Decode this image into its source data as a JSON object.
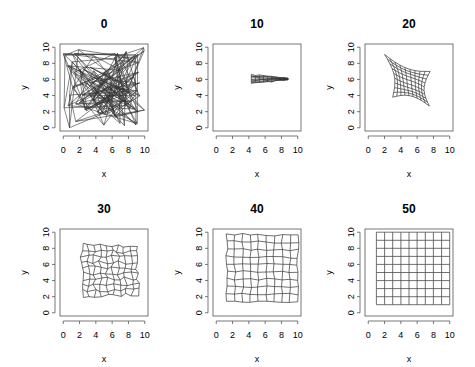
{
  "chart_data": {
    "type": "line",
    "layout": {
      "rows": 2,
      "cols": 3
    },
    "xlim": [
      0,
      10
    ],
    "ylim": [
      0,
      10
    ],
    "x_ticks": [
      "0",
      "2",
      "4",
      "6",
      "8",
      "10"
    ],
    "y_ticks": [
      "0",
      "2",
      "4",
      "6",
      "8",
      "10"
    ],
    "grid": false,
    "panels": [
      {
        "title": "0",
        "xlabel": "x",
        "ylabel": "y",
        "state": "random",
        "note": "lattice nodes at random positions in [0,10]; tangled lines"
      },
      {
        "title": "10",
        "xlabel": "x",
        "ylabel": "y",
        "state": "collapsed",
        "extent": {
          "x": [
            4.3,
            8.8
          ],
          "y": [
            5.5,
            6.6
          ]
        }
      },
      {
        "title": "20",
        "xlabel": "x",
        "ylabel": "y",
        "state": "warped",
        "corners": {
          "tl": [
            2.0,
            9.1
          ],
          "tr": [
            7.6,
            7.0
          ],
          "br": [
            7.5,
            2.7
          ],
          "bl": [
            3.0,
            3.8
          ]
        }
      },
      {
        "title": "30",
        "xlabel": "x",
        "ylabel": "y",
        "state": "near-regular",
        "corners": {
          "tl": [
            2.3,
            8.5
          ],
          "tr": [
            8.9,
            8.2
          ],
          "br": [
            9.3,
            2.3
          ],
          "bl": [
            2.3,
            2.0
          ]
        }
      },
      {
        "title": "40",
        "xlabel": "x",
        "ylabel": "y",
        "state": "almost-regular",
        "corners": {
          "tl": [
            1.3,
            9.8
          ],
          "tr": [
            10.0,
            9.6
          ],
          "br": [
            10.0,
            1.4
          ],
          "bl": [
            1.3,
            1.4
          ]
        }
      },
      {
        "title": "50",
        "xlabel": "x",
        "ylabel": "y",
        "state": "regular",
        "corners": {
          "tl": [
            1,
            10
          ],
          "tr": [
            10,
            10
          ],
          "br": [
            10,
            1
          ],
          "bl": [
            1,
            1
          ]
        }
      }
    ],
    "grid_size": 10
  },
  "colors": {
    "lines": "#333333",
    "axes": "#555555"
  }
}
